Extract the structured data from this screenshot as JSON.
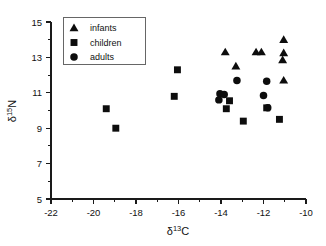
{
  "chart_data": {
    "type": "scatter",
    "title": "",
    "xlabel": "δ13C",
    "ylabel": "δ15N",
    "xlabel_parts": {
      "delta": "δ",
      "sup": "13",
      "element": "C"
    },
    "ylabel_parts": {
      "delta": "δ",
      "sup": "15",
      "element": "N"
    },
    "xlim": [
      -22,
      -10
    ],
    "ylim": [
      5,
      15
    ],
    "xticks": [
      -22,
      -20,
      -18,
      -16,
      -14,
      -12,
      -10
    ],
    "xtick_labels": [
      "-22",
      "-20",
      "-18",
      "-16",
      "-14",
      "-12",
      "-10"
    ],
    "yticks": [
      5,
      7,
      9,
      11,
      13,
      15
    ],
    "ytick_labels": [
      "5",
      "7",
      "9",
      "11",
      "13",
      "15"
    ],
    "x_minor_ticks": [
      -21,
      -19,
      -17,
      -15,
      -13,
      -11
    ],
    "y_minor_ticks": [
      6,
      8,
      10,
      12,
      14
    ],
    "grid": false,
    "legend_position": "top-left",
    "marker_color": "#0d0d0d",
    "series": [
      {
        "name": "infants",
        "marker": "triangle",
        "points": [
          {
            "x": -13.8,
            "y": 13.3
          },
          {
            "x": -13.3,
            "y": 12.5
          },
          {
            "x": -12.35,
            "y": 13.3
          },
          {
            "x": -12.1,
            "y": 13.3
          },
          {
            "x": -11.05,
            "y": 14.0
          },
          {
            "x": -11.05,
            "y": 13.25
          },
          {
            "x": -11.1,
            "y": 12.85
          },
          {
            "x": -11.05,
            "y": 11.7
          }
        ]
      },
      {
        "name": "children",
        "marker": "square",
        "points": [
          {
            "x": -19.4,
            "y": 10.1
          },
          {
            "x": -18.95,
            "y": 9.0
          },
          {
            "x": -16.2,
            "y": 10.8
          },
          {
            "x": -16.05,
            "y": 12.3
          },
          {
            "x": -13.75,
            "y": 10.1
          },
          {
            "x": -13.6,
            "y": 10.55
          },
          {
            "x": -12.95,
            "y": 9.4
          },
          {
            "x": -11.85,
            "y": 10.15
          },
          {
            "x": -11.25,
            "y": 9.5
          }
        ]
      },
      {
        "name": "adults",
        "marker": "circle",
        "points": [
          {
            "x": -14.05,
            "y": 10.95
          },
          {
            "x": -14.1,
            "y": 10.6
          },
          {
            "x": -13.85,
            "y": 10.9
          },
          {
            "x": -13.25,
            "y": 11.7
          },
          {
            "x": -12.0,
            "y": 10.85
          },
          {
            "x": -11.85,
            "y": 11.65
          },
          {
            "x": -11.8,
            "y": 10.15
          }
        ]
      }
    ]
  },
  "legend": {
    "items": [
      {
        "label": "infants",
        "marker": "triangle"
      },
      {
        "label": "children",
        "marker": "square"
      },
      {
        "label": "adults",
        "marker": "circle"
      }
    ]
  }
}
